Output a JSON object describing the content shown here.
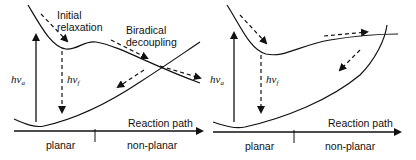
{
  "panels": [
    {
      "id": "left",
      "labels": {
        "initial_relaxation_1": "Initial",
        "initial_relaxation_2": "relaxation",
        "biradical_1": "Biradical",
        "biradical_2": "decoupling",
        "absorption": "hν",
        "absorption_sub": "a",
        "fluorescence": "hν",
        "fluorescence_sub": "f",
        "axis": "Reaction path",
        "region_left": "planar",
        "region_right": "non-planar"
      }
    },
    {
      "id": "right",
      "labels": {
        "absorption": "hν",
        "absorption_sub": "a",
        "fluorescence": "hν",
        "fluorescence_sub": "f",
        "axis": "Reaction path",
        "region_left": "planar",
        "region_right": "non-planar"
      }
    }
  ],
  "colors": {
    "line": "#111111",
    "background": "#ffffff"
  }
}
